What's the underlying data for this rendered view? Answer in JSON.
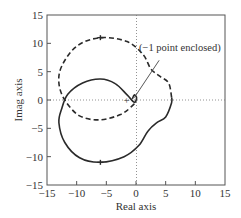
{
  "chart_data": {
    "type": "line",
    "title": "",
    "xlabel": "Real axis",
    "ylabel": "Imag axis",
    "xlim": [
      -15,
      15
    ],
    "ylim": [
      -15,
      15
    ],
    "xticks": [
      -15,
      -10,
      -5,
      0,
      5,
      10,
      15
    ],
    "yticks": [
      -15,
      -10,
      -5,
      0,
      5,
      10,
      15
    ],
    "xtick_labels": [
      "−15",
      "−10",
      "−5",
      "0",
      "5",
      "10",
      "15"
    ],
    "ytick_labels": [
      "15",
      "10",
      "5",
      "0",
      "−5",
      "−10",
      "−15"
    ],
    "grid": false,
    "reference_lines": [
      "x=0 dotted",
      "y=0 dotted"
    ],
    "annotation": {
      "text": "(−1 point enclosed)",
      "arrow_from": [
        3.9,
        7
      ],
      "arrow_to": [
        -0.3,
        0.4
      ]
    },
    "critical_point_marker": {
      "label": "+",
      "x": -1.6,
      "y": 0
    },
    "series": [
      {
        "name": "positive frequencies",
        "style": "solid",
        "points": [
          [
            -0.6,
            0.2
          ],
          [
            -0.3,
            0.9
          ],
          [
            0.1,
            0.4
          ],
          [
            -0.3,
            -0.4
          ],
          [
            -1.5,
            0.9
          ],
          [
            -3.5,
            2.9
          ],
          [
            -6,
            3.7
          ],
          [
            -9,
            3.0
          ],
          [
            -11.5,
            1.0
          ],
          [
            -12.5,
            -1.5
          ],
          [
            -13,
            -4
          ],
          [
            -12,
            -7.5
          ],
          [
            -9.5,
            -10.2
          ],
          [
            -6,
            -11
          ],
          [
            -2,
            -10
          ],
          [
            0.5,
            -8
          ],
          [
            2,
            -5.5
          ],
          [
            3.5,
            -4
          ],
          [
            5,
            -3
          ],
          [
            6,
            -0.5
          ],
          [
            6,
            0.5
          ]
        ],
        "markers": [
          [
            -6,
            -11
          ]
        ]
      },
      {
        "name": "negative frequencies",
        "style": "dashed",
        "points": [
          [
            6,
            0.5
          ],
          [
            5.5,
            3
          ],
          [
            4,
            4.2
          ],
          [
            2.5,
            5.5
          ],
          [
            1.2,
            8
          ],
          [
            -1.5,
            10.3
          ],
          [
            -6,
            11
          ],
          [
            -10,
            9.5
          ],
          [
            -12.5,
            6
          ],
          [
            -13,
            3
          ],
          [
            -12,
            0
          ],
          [
            -9.5,
            -2.8
          ],
          [
            -6,
            -3.5
          ],
          [
            -2.5,
            -2.5
          ],
          [
            -0.5,
            -0.9
          ],
          [
            0,
            -0.2
          ]
        ],
        "markers": [
          [
            -6,
            11
          ]
        ]
      }
    ]
  }
}
